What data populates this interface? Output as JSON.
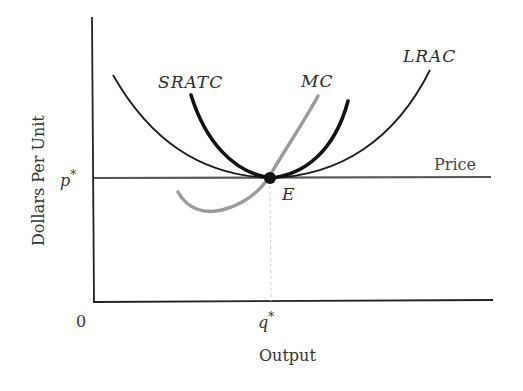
{
  "diagram": {
    "title": "",
    "axes": {
      "x_label": "Output",
      "y_label": "Dollars Per Unit",
      "origin_label": "0",
      "x_tick": "q",
      "x_tick_sup": "*",
      "y_tick": "p",
      "y_tick_sup": "*"
    },
    "curves": {
      "lrac": {
        "label": "LRAC",
        "color": "#1a1a1a"
      },
      "sratc": {
        "label": "SRATC",
        "color": "#111111"
      },
      "mc": {
        "label": "MC",
        "color": "#9a9a9a"
      },
      "price": {
        "label": "Price",
        "color": "#555555"
      }
    },
    "equilibrium": {
      "label": "E",
      "color": "#111111"
    }
  }
}
